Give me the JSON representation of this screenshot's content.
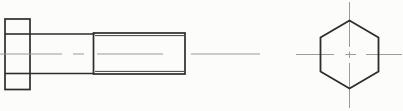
{
  "canvas": {
    "width": 403,
    "height": 111,
    "background": "#fcfcfb"
  },
  "palette": {
    "outline": "#2d2d2d",
    "centerline": "#9b9b9b"
  },
  "drawing": {
    "subject": "hex-head-bolt-orthographic-views",
    "views": [
      "side-view",
      "end-view"
    ]
  },
  "shapes": [
    {
      "name": "bolt-head-outline",
      "type": "rect",
      "x": 5,
      "y": 19,
      "w": 25,
      "h": 70.5,
      "stroke": "outline",
      "sw": 1.7
    },
    {
      "name": "bolt-head-upper-flat-line",
      "type": "line",
      "x1": 5,
      "y1": 34,
      "x2": 30,
      "y2": 34,
      "stroke": "outline",
      "sw": 1.6
    },
    {
      "name": "bolt-head-lower-flat-line",
      "type": "line",
      "x1": 5,
      "y1": 73.5,
      "x2": 30,
      "y2": 73.5,
      "stroke": "outline",
      "sw": 1.6
    },
    {
      "name": "bolt-shank-upper-line",
      "type": "line",
      "x1": 30,
      "y1": 34,
      "x2": 94.5,
      "y2": 34,
      "stroke": "outline",
      "sw": 1.6
    },
    {
      "name": "bolt-shank-lower-line",
      "type": "line",
      "x1": 30,
      "y1": 73.5,
      "x2": 94.5,
      "y2": 73.5,
      "stroke": "outline",
      "sw": 1.6
    },
    {
      "name": "bolt-thread-outline",
      "type": "rect",
      "x": 93.5,
      "y": 33,
      "w": 91.5,
      "h": 41,
      "stroke": "outline",
      "sw": 1.7
    },
    {
      "name": "bolt-thread-minor-upper-line",
      "type": "line",
      "x1": 95,
      "y1": 35.6,
      "x2": 184,
      "y2": 35.6,
      "stroke": "outline",
      "sw": 0.9
    },
    {
      "name": "bolt-thread-minor-lower-line",
      "type": "line",
      "x1": 95,
      "y1": 71.4,
      "x2": 184,
      "y2": 71.4,
      "stroke": "outline",
      "sw": 0.9
    },
    {
      "name": "side-view-center-line-dash",
      "type": "line",
      "x1": 0,
      "y1": 54,
      "x2": 62,
      "y2": 54,
      "stroke": "centerline",
      "sw": 1
    },
    {
      "name": "side-view-center-line-dash",
      "type": "line",
      "x1": 73,
      "y1": 54,
      "x2": 84,
      "y2": 54,
      "stroke": "centerline",
      "sw": 1
    },
    {
      "name": "side-view-center-line-dash",
      "type": "line",
      "x1": 97,
      "y1": 54,
      "x2": 163,
      "y2": 54,
      "stroke": "centerline",
      "sw": 1
    },
    {
      "name": "side-view-center-line-dash",
      "type": "line",
      "x1": 191,
      "y1": 54,
      "x2": 260,
      "y2": 54,
      "stroke": "centerline",
      "sw": 1
    },
    {
      "name": "end-view-horizontal-center-line-dash",
      "type": "line",
      "x1": 296,
      "y1": 54.5,
      "x2": 334,
      "y2": 54.5,
      "stroke": "centerline",
      "sw": 1
    },
    {
      "name": "end-view-horizontal-center-line-dash",
      "type": "line",
      "x1": 345.5,
      "y1": 54.5,
      "x2": 356,
      "y2": 54.5,
      "stroke": "centerline",
      "sw": 1
    },
    {
      "name": "end-view-horizontal-center-line-dash",
      "type": "line",
      "x1": 366,
      "y1": 54.5,
      "x2": 402,
      "y2": 54.5,
      "stroke": "centerline",
      "sw": 1
    },
    {
      "name": "end-view-vertical-center-line-dash",
      "type": "line",
      "x1": 349.5,
      "y1": 2,
      "x2": 349.5,
      "y2": 47,
      "stroke": "centerline",
      "sw": 1
    },
    {
      "name": "end-view-vertical-center-line-dash",
      "type": "line",
      "x1": 349.5,
      "y1": 51.5,
      "x2": 349.5,
      "y2": 58,
      "stroke": "centerline",
      "sw": 1
    },
    {
      "name": "end-view-vertical-center-line-dash",
      "type": "line",
      "x1": 349.5,
      "y1": 63,
      "x2": 349.5,
      "y2": 108,
      "stroke": "centerline",
      "sw": 1
    },
    {
      "name": "hex-head-outline",
      "type": "polygon",
      "points": "349.5,20.5 378.5,37.5 378.5,71.5 349.5,88.5 320.5,71.5 320.5,37.5",
      "stroke": "outline",
      "sw": 1.8
    }
  ]
}
